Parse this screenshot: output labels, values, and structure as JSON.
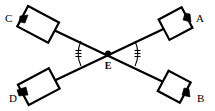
{
  "figure": {
    "type": "geometry-diagram",
    "background_color": "#ffffff",
    "stroke_color": "#000000",
    "width": 215,
    "height": 111
  },
  "labels": {
    "a": "A",
    "b": "B",
    "c": "C",
    "d": "D",
    "e": "E"
  },
  "points": {
    "a": {
      "label": "A",
      "x": 200,
      "y": 18,
      "corner": "top-right"
    },
    "b": {
      "label": "B",
      "x": 201,
      "y": 98,
      "corner": "bottom-right"
    },
    "c": {
      "label": "C",
      "x": 9,
      "y": 18,
      "corner": "top-left"
    },
    "d": {
      "label": "D",
      "x": 13,
      "y": 98,
      "corner": "bottom-left"
    },
    "e": {
      "label": "E",
      "x": 108,
      "y": 53,
      "corner": "center"
    }
  },
  "segments": [
    {
      "name": "segment-C-to-B",
      "from": "C",
      "to": "B"
    },
    {
      "name": "segment-A-to-D",
      "from": "A",
      "to": "D"
    }
  ],
  "boxes": [
    {
      "name": "box-a",
      "at": "A",
      "rotation_deg": -28,
      "w": 26,
      "h": 22
    },
    {
      "name": "box-b",
      "at": "B",
      "rotation_deg": 28,
      "w": 24,
      "h": 22
    },
    {
      "name": "box-c",
      "at": "C",
      "rotation_deg": 28,
      "w": 34,
      "h": 23
    },
    {
      "name": "box-d",
      "at": "D",
      "rotation_deg": -28,
      "w": 34,
      "h": 23
    }
  ],
  "angle_marks": [
    {
      "name": "angle-mark-left",
      "at": "E",
      "opens": "left",
      "ticks": 3
    },
    {
      "name": "angle-mark-right",
      "at": "E",
      "opens": "right",
      "ticks": 3
    }
  ],
  "arrowheads": [
    {
      "name": "arrowhead-a",
      "at": "A"
    },
    {
      "name": "arrowhead-b",
      "at": "B"
    },
    {
      "name": "arrowhead-c",
      "at": "C"
    },
    {
      "name": "arrowhead-d",
      "at": "D"
    }
  ]
}
